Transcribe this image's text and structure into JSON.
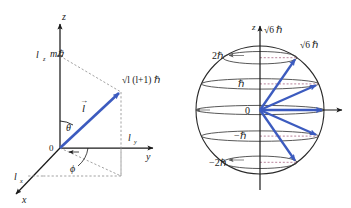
{
  "figure": {
    "background_color": "#ffffff",
    "vector_color": "#3c5bbf",
    "axis_color": "#1a1a1a",
    "dashed_color": "#8a8a8a"
  },
  "left_panel": {
    "name": "angular-momentum-vector-diagram",
    "axes": {
      "z_label": "z",
      "x_label": "x",
      "y_label": "y",
      "lz_label": "l",
      "lz_sub": "z",
      "lx_label": "l",
      "lx_sub": "x",
      "ly_label": "l",
      "ly_sub": "y"
    },
    "origin_label": "0",
    "vector_label": "l",
    "vector_arrow_accent": "→",
    "polar_angle_label": "θ",
    "azimuth_angle_label": "ϕ",
    "z_projection_label": "mℏ",
    "magnitude_label_parts": {
      "radical": "√",
      "expr": "l (l+1)",
      "hbar": "ℏ"
    },
    "magnitude_label_full": "√l (l+1) ℏ"
  },
  "right_panel": {
    "name": "space-quantization-sphere",
    "axis_z_label": "z",
    "origin_label": "0",
    "radius_label": "√6 ℏ",
    "radius_label_top": "√6 ℏ",
    "quantum_number_l": 2,
    "magnitude_value": "√6 ℏ",
    "m_levels": [
      {
        "m": 2,
        "label": "2ℏ",
        "z_frac": 0.8165
      },
      {
        "m": 1,
        "label": "ℏ",
        "z_frac": 0.4082
      },
      {
        "m": 0,
        "label": "0",
        "z_frac": 0.0
      },
      {
        "m": -1,
        "label": "−ℏ",
        "z_frac": -0.4082
      },
      {
        "m": -2,
        "label": "−2ℏ",
        "z_frac": -0.8165
      }
    ]
  }
}
